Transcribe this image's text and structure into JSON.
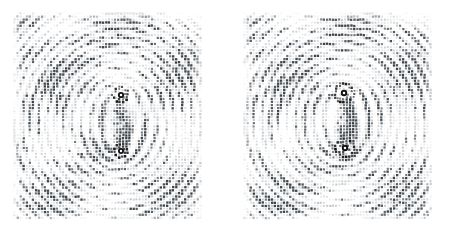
{
  "figure": {
    "title": "",
    "caption": "",
    "background_color": "#ffffff",
    "width": 462,
    "height": 238,
    "panel_count": 2
  },
  "chart_data": {
    "type": "scatter",
    "title": "",
    "subtitle": "",
    "xlabel": "",
    "ylabel": "",
    "grid": false,
    "legend": null,
    "annotations": [],
    "render": {
      "dot_shape": "square",
      "dot_size_px": 1.75,
      "base_color": "#9aa0a6",
      "core_color": "#111111",
      "dark_color": "#333a40",
      "light_color": "#d7dadd",
      "lattice_spacing_px": 3.05,
      "max_alpha": 0.95,
      "min_alpha": 0.06
    },
    "panels": [
      {
        "name": "panel-left",
        "index": 0,
        "origin_x": 13,
        "origin_y": 12,
        "width": 190,
        "height": 210,
        "lattice_spacing": 3.05,
        "lattice_angle_deg": 0,
        "fringe_strength": 0.62,
        "fringe_angle_deg": 24,
        "fringe_period_px": 26,
        "noise_amplitude": 0.33,
        "cores": [
          {
            "id": "vortex-upper-left-panel",
            "cx": 121,
            "cy": 95,
            "charge": 1,
            "core_radius_px": 3.1,
            "ring_radius_px": 7.4,
            "ring_thickness_px": 1.5,
            "halo_radius_px": 16,
            "strain_amplitude": 2.05
          },
          {
            "id": "vortex-lower-left-panel",
            "cx": 121,
            "cy": 151,
            "charge": -1,
            "core_radius_px": 3.0,
            "ring_radius_px": 6.6,
            "ring_thickness_px": 1.4,
            "halo_radius_px": 15,
            "strain_amplitude": 2.0
          }
        ]
      },
      {
        "name": "panel-right",
        "index": 1,
        "origin_x": 243,
        "origin_y": 12,
        "width": 190,
        "height": 210,
        "lattice_spacing": 3.05,
        "lattice_angle_deg": 0,
        "fringe_strength": 0.7,
        "fringe_angle_deg": -18,
        "fringe_period_px": 30,
        "noise_amplitude": 0.3,
        "cores": [
          {
            "id": "vortex-upper-right-panel",
            "cx": 344,
            "cy": 93,
            "charge": 1,
            "core_radius_px": 3.2,
            "ring_radius_px": 9.2,
            "ring_thickness_px": 1.7,
            "halo_radius_px": 19,
            "strain_amplitude": 2.35
          },
          {
            "id": "vortex-lower-right-panel",
            "cx": 345,
            "cy": 148,
            "charge": -1,
            "core_radius_px": 3.2,
            "ring_radius_px": 9.0,
            "ring_thickness_px": 1.7,
            "halo_radius_px": 19,
            "strain_amplitude": 2.3
          }
        ]
      }
    ]
  }
}
